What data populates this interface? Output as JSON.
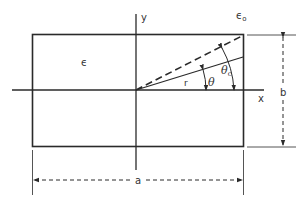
{
  "diagram": {
    "labels": {
      "y_axis": "y",
      "x_axis": "x",
      "permittivity_inside": "ϵ",
      "permittivity_outside": "ϵ",
      "permittivity_outside_sub": "o",
      "radius": "r",
      "theta": "θ",
      "theta_c": "θ",
      "theta_c_sub": "c",
      "width_dim": "a",
      "height_dim": "b"
    },
    "colors": {
      "line": "#2a2a2a",
      "background": "#ffffff"
    }
  }
}
